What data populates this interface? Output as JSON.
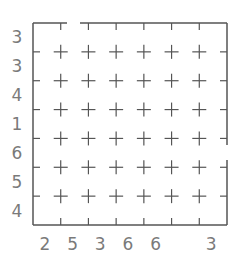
{
  "puzzle": {
    "type": "skyscraper-like grid clue puzzle",
    "rows": 7,
    "cols": 7,
    "row_clues": [
      "3",
      "3",
      "4",
      "1",
      "6",
      "5",
      "4"
    ],
    "col_clues": [
      "2",
      "5",
      "3",
      "6",
      "6",
      "",
      "3"
    ],
    "border_gaps": {
      "top": "between column 1 and column 2",
      "right": "between row 4 and row 5"
    },
    "line_color": "#555555",
    "label_color": "#7a7a7a"
  }
}
